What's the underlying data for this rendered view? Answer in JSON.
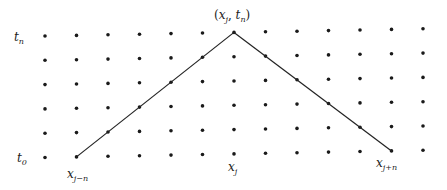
{
  "diagram": {
    "grid": {
      "columns": 13,
      "rows": 6
    },
    "apex": {
      "column": 6,
      "row": 0
    },
    "left_foot": {
      "column": 1,
      "row": 5
    },
    "right_foot": {
      "column": 11,
      "row": 5
    },
    "colors": {
      "dot": "#1a1a1a",
      "line": "#222222",
      "text": "#222222"
    },
    "labels": {
      "t_top": {
        "base": "t",
        "sub": "n"
      },
      "t_bottom": {
        "base": "t",
        "sub": "0"
      },
      "x_left": {
        "base": "x",
        "sub": "j−n"
      },
      "x_center": {
        "base": "x",
        "sub": "j"
      },
      "x_right": {
        "base": "x",
        "sub": "j+n"
      },
      "apex": {
        "open": "(",
        "x": "x",
        "xsub": "j",
        "comma": ", ",
        "t": "t",
        "tsub": "n",
        "close": ")"
      }
    }
  }
}
